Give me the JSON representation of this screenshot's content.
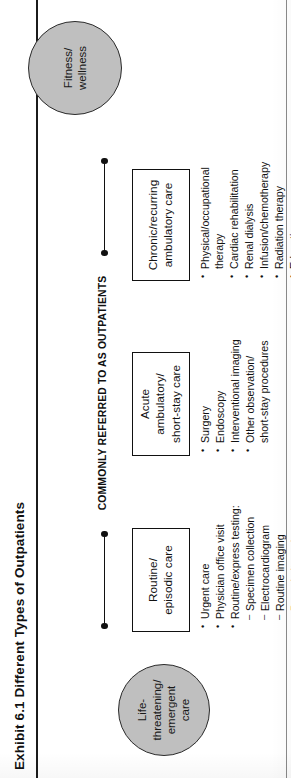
{
  "exhibit": {
    "title": "Exhibit 6.1 Different Types of Outpatients",
    "span_caption": "COMMONLY REFERRED TO AS OUTPATIENTS"
  },
  "circles": {
    "left": "Life-\nthreatening/\nemergent\ncare",
    "right": "Fitness/\nwellness"
  },
  "columns": [
    {
      "heading": "Routine/\nepisodic care",
      "items": [
        {
          "text": "Urgent care",
          "level": 1
        },
        {
          "text": "Physician office visit",
          "level": 1
        },
        {
          "text": "Routine/express testing:",
          "level": 1
        },
        {
          "text": "Specimen collection",
          "level": 2
        },
        {
          "text": "Electrocardiogram",
          "level": 2
        },
        {
          "text": "Routine imaging",
          "level": 2
        },
        {
          "text": "Pre-admit services",
          "level": 2
        }
      ]
    },
    {
      "heading": "Acute ambulatory/\nshort-stay care",
      "items": [
        {
          "text": "Surgery",
          "level": 1
        },
        {
          "text": "Endoscopy",
          "level": 1
        },
        {
          "text": "Interventional imaging",
          "level": 1
        },
        {
          "text": "Other observation/\nshort-stay procedures",
          "level": 1
        }
      ]
    },
    {
      "heading": "Chronic/recurring\nambulatory care",
      "items": [
        {
          "text": "Physical/occupational\ntherapy",
          "level": 1
        },
        {
          "text": "Cardiac rehabilitation",
          "level": 1
        },
        {
          "text": "Renal dialysis",
          "level": 1
        },
        {
          "text": "Infusion/chemotherapy",
          "level": 1
        },
        {
          "text": "Radiation therapy",
          "level": 1
        },
        {
          "text": "Education",
          "level": 1
        },
        {
          "text": "Behavioral health",
          "level": 1
        }
      ]
    }
  ],
  "colors": {
    "circle_fill": "#bfbfbf",
    "ink": "#111111",
    "page": "#ffffff"
  }
}
